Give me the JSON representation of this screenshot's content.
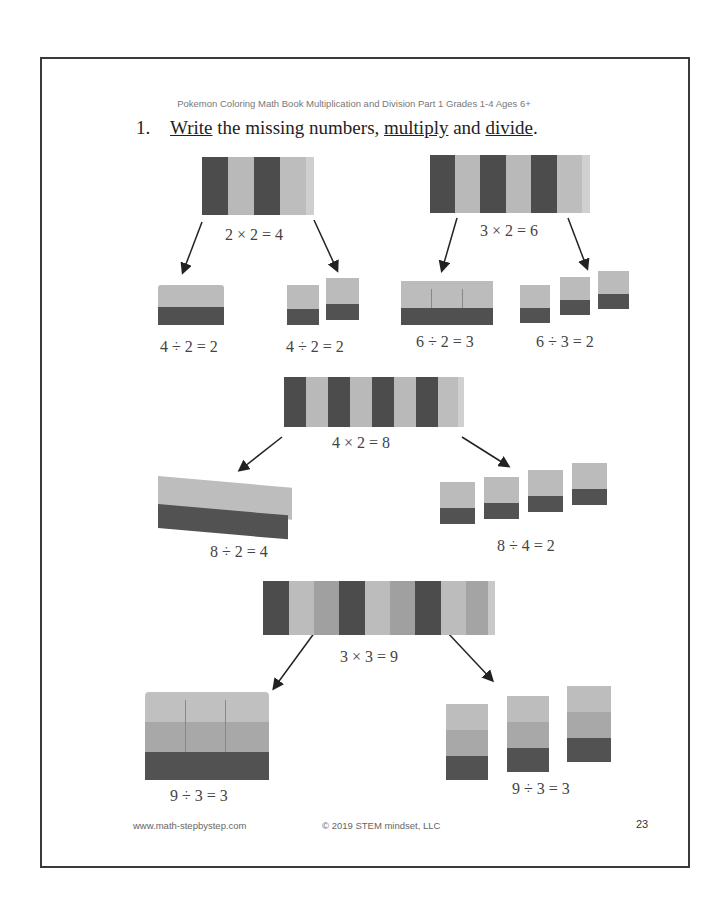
{
  "header": {
    "running_title": "Pokemon Coloring Math Book Multiplication and Division Part 1 Grades 1-4 Ages 6+"
  },
  "exercise": {
    "number": "1.",
    "instruction_parts": [
      {
        "text": "Write",
        "underline": true
      },
      {
        "text": " the missing numbers, ",
        "underline": false
      },
      {
        "text": "multiply",
        "underline": true
      },
      {
        "text": " and ",
        "underline": false
      },
      {
        "text": "divide",
        "underline": true
      },
      {
        "text": ".",
        "underline": false
      }
    ]
  },
  "problems": [
    {
      "multiplication": "2 × 2 = 4",
      "divisions": [
        "4 ÷ 2 = 2",
        "4 ÷ 2 = 2"
      ]
    },
    {
      "multiplication": "3 × 2 = 6",
      "divisions": [
        "6 ÷ 2 = 3",
        "6 ÷ 3 = 2"
      ]
    },
    {
      "multiplication": "4 × 2 = 8",
      "divisions": [
        "8 ÷ 2 = 4",
        "8 ÷ 4 = 2"
      ]
    },
    {
      "multiplication": "3 × 3 = 9",
      "divisions": [
        "9 ÷ 3 = 3",
        "9 ÷ 3 = 3"
      ]
    }
  ],
  "footer": {
    "website": "www.math-stepbystep.com",
    "copyright": "© 2019 STEM mindset, LLC",
    "page_number": "23"
  },
  "colors": {
    "dark_block": "#4a4a4a",
    "light_block": "#b8b8b8",
    "mid_block": "#9a9a9a",
    "border": "#3a3a3a"
  }
}
